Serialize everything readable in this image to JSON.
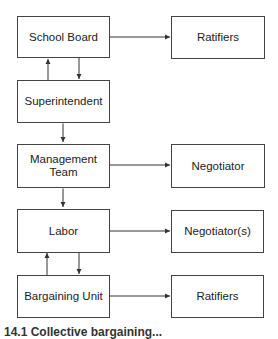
{
  "diagram": {
    "left_column": [
      {
        "id": "school-board",
        "label": "School Board"
      },
      {
        "id": "superintendent",
        "label": "Superintendent"
      },
      {
        "id": "management-team",
        "label": "Management Team"
      },
      {
        "id": "labor",
        "label": "Labor"
      },
      {
        "id": "bargaining-unit",
        "label": "Bargaining Unit"
      }
    ],
    "right_column": [
      {
        "id": "ratifiers-top",
        "label": "Ratifiers"
      },
      {
        "id": "negotiator",
        "label": "Negotiator"
      },
      {
        "id": "negotiators",
        "label": "Negotiator(s)"
      },
      {
        "id": "ratifiers-bottom",
        "label": "Ratifiers"
      }
    ],
    "edges": [
      {
        "from": "School Board",
        "to": "Ratifiers"
      },
      {
        "from": "School Board",
        "to": "Superintendent"
      },
      {
        "from": "Superintendent",
        "to": "School Board"
      },
      {
        "from": "Superintendent",
        "to": "Management Team",
        "bidirectional": true
      },
      {
        "from": "Management Team",
        "to": "Negotiator"
      },
      {
        "from": "Management Team",
        "to": "Labor",
        "bidirectional": true
      },
      {
        "from": "Labor",
        "to": "Negotiator(s)"
      },
      {
        "from": "Labor",
        "to": "Bargaining Unit"
      },
      {
        "from": "Bargaining Unit",
        "to": "Labor"
      },
      {
        "from": "Bargaining Unit",
        "to": "Ratifiers"
      }
    ],
    "caption": "14.1 Collective bargaining..."
  }
}
